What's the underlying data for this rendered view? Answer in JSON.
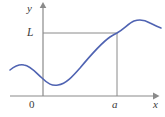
{
  "figure": {
    "kind": "cartesian-graph",
    "width": 165,
    "height": 117,
    "background_color": "#ffffff"
  },
  "axes": {
    "color": "#8a8a8a",
    "stroke_width": 1.2,
    "y_axis_label": "y",
    "x_axis_label": "x",
    "origin_label": "0",
    "y_axis_x": 43,
    "y_axis_top": 5,
    "x_axis_y": 96,
    "x_axis_left": 10,
    "x_axis_right": 156
  },
  "guides": {
    "color": "#8a8a8a",
    "stroke_width": 1.0,
    "horizontal_level_label": "L",
    "horizontal_level_y": 33,
    "horizontal_level_x_start": 43,
    "horizontal_level_x_end": 117,
    "vertical_marker_label": "a",
    "vertical_marker_x": 117,
    "vertical_marker_y_top": 33,
    "vertical_marker_y_bottom": 96
  },
  "curve": {
    "color": "#4f63b2",
    "stroke_width": 1.6,
    "path": "M 10,70 C 15,66 19,64 24,65 C 31,66 36,73 42,78 C 48,84 52,86 58,85 C 66,84 73,76 80,68 C 90,56 100,44 110,37 C 113,35 115,34 117,33 C 124,29 129,23 134,21 C 140,19 145,20 150,23 C 154,25 158,27 161,28",
    "intersection_point": {
      "x": 117,
      "y": 33
    }
  },
  "chart_data": {
    "type": "line",
    "title": "",
    "xlabel": "x",
    "ylabel": "y",
    "annotations": [
      "L",
      "a",
      "0"
    ],
    "series": [
      {
        "name": "f(x)",
        "points": [
          {
            "x": 10,
            "y": 70
          },
          {
            "x": 24,
            "y": 65
          },
          {
            "x": 42,
            "y": 78
          },
          {
            "x": 58,
            "y": 85
          },
          {
            "x": 80,
            "y": 68
          },
          {
            "x": 110,
            "y": 37
          },
          {
            "x": 117,
            "y": 33
          },
          {
            "x": 134,
            "y": 21
          },
          {
            "x": 150,
            "y": 23
          },
          {
            "x": 161,
            "y": 28
          }
        ]
      }
    ],
    "reference_lines": [
      {
        "orientation": "horizontal",
        "label": "L",
        "value": 33
      },
      {
        "orientation": "vertical",
        "label": "a",
        "value": 117
      }
    ],
    "grid": false,
    "legend": "none"
  }
}
